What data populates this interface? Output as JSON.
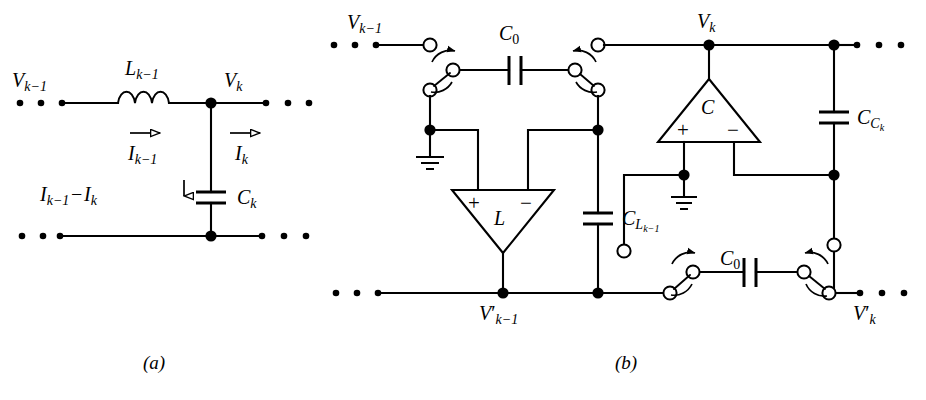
{
  "figure": {
    "width": 926,
    "height": 400,
    "background": "#ffffff",
    "ink": "#000000"
  },
  "captions": {
    "a": "(a)",
    "b": "(b)"
  },
  "circuit_a": {
    "name": "LC ladder section",
    "labels": {
      "v_prev": {
        "base": "V",
        "sub": "k−1"
      },
      "v_k": {
        "base": "V",
        "sub": "k"
      },
      "inductor": {
        "base": "L",
        "sub": "k−1"
      },
      "capacitor": {
        "base": "C",
        "sub": "k"
      },
      "current_in": {
        "base": "I",
        "sub": "k−1"
      },
      "current_out": {
        "base": "I",
        "sub": "k"
      },
      "current_shunt": {
        "base": "I",
        "sub": "k−1",
        "op": " − ",
        "base2": "I",
        "sub2": "k"
      }
    },
    "components": [
      {
        "type": "inductor",
        "label": "L_{k-1}"
      },
      {
        "type": "capacitor",
        "label": "C_k"
      }
    ],
    "ellipsis_count": 3
  },
  "circuit_b": {
    "name": "Switched-capacitor equivalent",
    "labels": {
      "v_prev": {
        "base": "V",
        "sub": "k−1"
      },
      "v_k": {
        "base": "V",
        "sub": "k"
      },
      "v_prev_prime": {
        "base": "V",
        "prime": "′",
        "sub": "k−1"
      },
      "v_k_prime": {
        "base": "V",
        "prime": "′",
        "sub": "k"
      },
      "c0_top": {
        "base": "C",
        "sub": "0"
      },
      "c0_bottom": {
        "base": "C",
        "sub": "0"
      },
      "c_l": {
        "base": "C",
        "sub": "L",
        "subsub": "k−1"
      },
      "c_c": {
        "base": "C",
        "sub": "C",
        "subsub": "k"
      }
    },
    "amplifiers": [
      {
        "name": "L",
        "label": "L",
        "plus": "+",
        "minus": "−",
        "orientation": "down"
      },
      {
        "name": "C",
        "label": "C",
        "plus": "+",
        "minus": "−",
        "orientation": "up"
      }
    ],
    "components": [
      {
        "type": "switched-capacitor",
        "label": "C_0",
        "position": "top"
      },
      {
        "type": "switched-capacitor",
        "label": "C_0",
        "position": "bottom"
      },
      {
        "type": "capacitor",
        "label": "C_{L_{k-1}}"
      },
      {
        "type": "capacitor",
        "label": "C_{C_k}"
      }
    ],
    "grounds": 2,
    "rotary_switches": 4,
    "ellipsis_count": 3
  }
}
